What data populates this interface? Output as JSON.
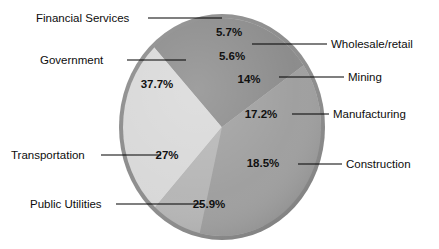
{
  "chart_data": {
    "type": "pie",
    "title": "",
    "subtitle": "",
    "xlabel": "",
    "ylabel": "",
    "legend_position": "callout-labels",
    "grid": false,
    "value_suffix": "%",
    "categories": [
      "Financial Services",
      "Wholesale/retail",
      "Mining",
      "Manufacturing",
      "Construction",
      "Public Utilities",
      "Transportation",
      "Government"
    ],
    "values": [
      5.7,
      5.6,
      14,
      17.2,
      18.5,
      25.9,
      27,
      37.7
    ],
    "value_labels": [
      "5.7%",
      "5.6%",
      "14%",
      "17.2%",
      "18.5%",
      "25.9%",
      "27%",
      "37.7%"
    ],
    "slice_colors": [
      "#b9b9b9",
      "#cfcfcf",
      "#c4c4c4",
      "#8f8f8f",
      "#b5b5b5",
      "#d8d8d8",
      "#8a8a8a",
      "#9e9e9e"
    ],
    "rim_color": "#8c8c8c",
    "background": "#ffffff",
    "label_color": "#111111"
  },
  "chart": {
    "slices": [
      {
        "name": "Financial Services",
        "value_label": "5.7%",
        "color": "#b9b9b9",
        "start_angle": 0,
        "end_angle": 20.5,
        "pct_x": 229,
        "pct_y": 36,
        "label_x": 36,
        "label_y": 22,
        "label_anchor": "start",
        "leader": "M 148 18 L 222 18"
      },
      {
        "name": "Wholesale/retail",
        "value_label": "5.6%",
        "color": "#cfcfcf",
        "start_angle": 20.5,
        "end_angle": 41.0,
        "pct_x": 232,
        "pct_y": 60,
        "label_x": 331,
        "label_y": 48,
        "label_anchor": "start",
        "leader": "M 252 44 L 327 44"
      },
      {
        "name": "Mining",
        "value_label": "14%",
        "color": "#c4c4c4",
        "start_angle": 41.0,
        "end_angle": 92.0,
        "pct_x": 249,
        "pct_y": 83,
        "label_x": 348,
        "label_y": 81,
        "label_anchor": "start",
        "leader": "M 279 77 L 344 77"
      },
      {
        "name": "Manufacturing",
        "value_label": "17.2%",
        "color": "#8f8f8f",
        "start_angle": 92.0,
        "end_angle": 155.0,
        "pct_x": 261,
        "pct_y": 118,
        "label_x": 333,
        "label_y": 118,
        "label_anchor": "start",
        "leader": "M 292 114 L 329 114"
      },
      {
        "name": "Construction",
        "value_label": "18.5%",
        "color": "#b5b5b5",
        "start_angle": 155.0,
        "end_angle": 222.5,
        "pct_x": 263,
        "pct_y": 167,
        "label_x": 346,
        "label_y": 168,
        "label_anchor": "start",
        "leader": "M 298 164 L 342 164"
      },
      {
        "name": "Public Utilities",
        "value_label": "25.9%",
        "color": "#d8d8d8",
        "start_angle": 222.5,
        "end_angle": 317.0,
        "pct_x": 209,
        "pct_y": 208,
        "label_x": 30,
        "label_y": 208,
        "label_anchor": "start",
        "leader": "M 116 204 L 203 204"
      },
      {
        "name": "Transportation",
        "value_label": "27%",
        "color": "#8a8a8a",
        "start_angle": 317.0,
        "end_angle": 415.5,
        "pct_x": 167,
        "pct_y": 159,
        "label_x": 11,
        "label_y": 159,
        "label_anchor": "start",
        "leader": "M 101 155 L 161 155"
      },
      {
        "name": "Government",
        "value_label": "37.7%",
        "color": "#9e9e9e",
        "start_angle": 415.5,
        "end_angle": 553.0,
        "pct_x": 157,
        "pct_y": 88,
        "label_x": 40,
        "label_y": 64,
        "label_anchor": "start",
        "leader": "M 127 60 L 186 60"
      }
    ]
  }
}
